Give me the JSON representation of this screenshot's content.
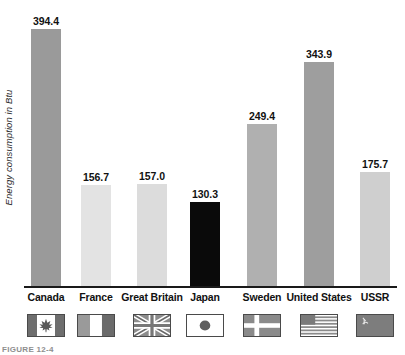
{
  "chart_data": {
    "type": "bar",
    "title": "",
    "xlabel": "",
    "ylabel": "Energy consumption in Btu",
    "ylim": [
      0,
      430
    ],
    "grid": false,
    "legend": "none",
    "categories": [
      "Canada",
      "France",
      "Great Britain",
      "Japan",
      "Sweden",
      "United States",
      "USSR"
    ],
    "values": [
      394.4,
      156.7,
      157.0,
      130.3,
      249.4,
      343.9,
      175.7
    ],
    "value_labels": [
      "394.4",
      "156.7",
      "157.0",
      "130.3",
      "249.4",
      "343.9",
      "175.7"
    ],
    "bar_colors": [
      "#9a9a9a",
      "#e3e3e3",
      "#dcdcdc",
      "#0a0a0a",
      "#b0b0b0",
      "#9e9e9e",
      "#cfcfcf"
    ],
    "flags": [
      "canada-flag-icon",
      "france-flag-icon",
      "great-britain-flag-icon",
      "japan-flag-icon",
      "sweden-flag-icon",
      "united-states-flag-icon",
      "ussr-flag-icon"
    ]
  },
  "caption": "FIGURE 12-4",
  "colors": {
    "axis": "#1a1a1a",
    "text": "#111111",
    "axis_title": "#2b2b2b",
    "caption": "#8e8e8e"
  }
}
